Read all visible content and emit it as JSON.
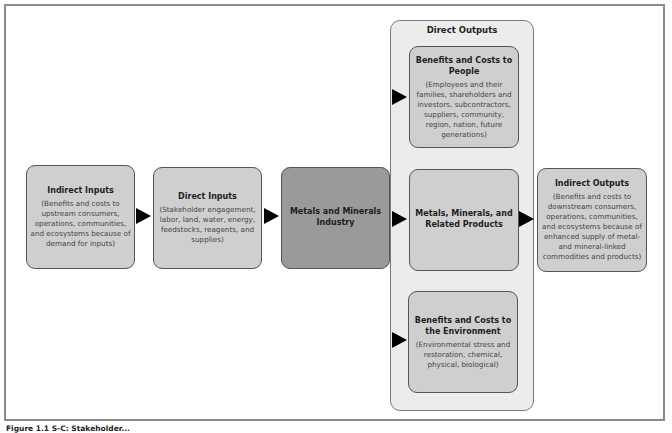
{
  "diagram": {
    "nodes": {
      "indirect_inputs": {
        "title": "Indirect Inputs",
        "description": "(Benefits and costs to upstream consumers, operations, communities, and ecosystems because of demand for inputs)"
      },
      "direct_inputs": {
        "title": "Direct Inputs",
        "description": "(Stakeholder engagement, labor, land, water, energy, feedstocks, reagents, and supplies)"
      },
      "industry": {
        "title": "Metals and Minerals Industry"
      },
      "direct_outputs": {
        "title": "Direct Outputs",
        "people": {
          "title": "Benefits and Costs to People",
          "description": "(Employees and their families, shareholders and investors, subcontractors, suppliers, community, region, nation, future generations)"
        },
        "products": {
          "title": "Metals, Minerals, and Related Products"
        },
        "environment": {
          "title": "Benefits and Costs to the Environment",
          "description": "(Environmental stress and restoration, chemical, physical, biological)"
        }
      },
      "indirect_outputs": {
        "title": "Indirect Outputs",
        "description": "(Benefits and costs to downstream consumers, operations, communities, and ecosystems because of enhanced supply of metal- and mineral-linked commodities and products)"
      }
    },
    "edges": [
      {
        "from": "Indirect Inputs",
        "to": "Direct Inputs"
      },
      {
        "from": "Direct Inputs",
        "to": "Metals and Minerals Industry"
      },
      {
        "from": "Metals and Minerals Industry",
        "to": "Benefits and Costs to People"
      },
      {
        "from": "Metals and Minerals Industry",
        "to": "Metals, Minerals, and Related Products"
      },
      {
        "from": "Metals and Minerals Industry",
        "to": "Benefits and Costs to the Environment"
      },
      {
        "from": "Direct Outputs",
        "to": "Indirect Outputs"
      }
    ],
    "colors": {
      "light_box": "#cfcfcf",
      "dark_box": "#9a9a9a",
      "container": "#ececec",
      "arrow": "#000000"
    }
  },
  "caption": "Figure 1.1 S-C: Stakeholder..."
}
